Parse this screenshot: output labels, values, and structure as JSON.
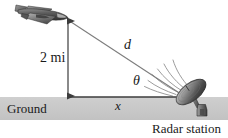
{
  "figure": {
    "width": 228,
    "height": 138,
    "background_color": "#ffffff"
  },
  "labels": {
    "altitude": "2 mi",
    "hypotenuse": "d",
    "angle": "θ",
    "ground": "Ground",
    "horizontal": "x",
    "station": "Radar station"
  },
  "colors": {
    "ground_band": "#c8c8c8",
    "ground_line": "#3c3c3c",
    "measure_arrow": "#3c3c3c",
    "hypotenuse_line": "#808080",
    "wave_arc": "#8a8a8a",
    "airplane_dark": "#4a4a4a",
    "airplane_mid": "#6e6e6e",
    "airplane_light": "#a8a8a8",
    "dish_dark": "#3f3f3f",
    "dish_light": "#b5b5b5",
    "text": "#1a1a1a"
  },
  "geometry": {
    "plane_point": [
      68,
      20
    ],
    "dish_point": [
      186,
      97
    ],
    "ground_line_y": 97,
    "ground_band_top": 97,
    "ground_band_bottom": 120,
    "vertical_arrow_x": 68,
    "horizontal_run_start_x": 68,
    "horizontal_run_end_x": 190,
    "wave_arc_count": 6
  },
  "icons": {
    "airplane": "airplane-icon",
    "dish": "satellite-dish-icon",
    "waves": "radar-waves-icon",
    "arrow": "double-arrow-icon"
  }
}
